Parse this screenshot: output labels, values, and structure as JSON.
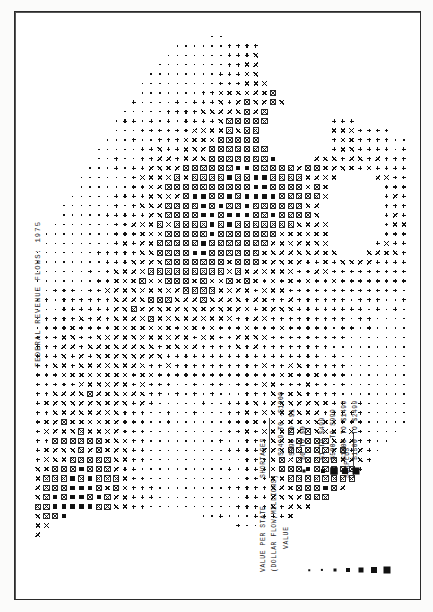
{
  "page": {
    "title": "FEDERAL REVENUE FLOWS: 1975",
    "background_color": "#ffffff",
    "ink_color": "#111111",
    "frame_color": "#2b2b2b"
  },
  "legend": {
    "title": "VALUE PER STATE",
    "subtitle": "(DOLLAR FLOW,MILLIONS)",
    "group_shortages": "SHORTAGES",
    "group_surplus": "SURPLUS",
    "entries": [
      {
        "symbol": "dot-xs",
        "size": 1,
        "label": "-$2499 TO -$1000",
        "group": "SHORTAGES"
      },
      {
        "symbol": "dot-s",
        "size": 2,
        "label": "-$999 TO -$1",
        "group": "SHORTAGES"
      },
      {
        "symbol": "dot-m",
        "size": 3,
        "label": "$0 TO $0",
        "group": "SHORTAGES"
      },
      {
        "symbol": "dot-l",
        "size": 4,
        "label": "$1 TO $499",
        "group": "SURPLUS"
      },
      {
        "symbol": "square-open",
        "size": 5,
        "label": "$500 TO $999",
        "group": "SURPLUS"
      },
      {
        "symbol": "square-m",
        "size": 6,
        "label": "$1000 TO $1499",
        "group": "SURPLUS"
      },
      {
        "symbol": "square-l",
        "size": 7,
        "label": "$1500 TO $2499",
        "group": "SURPLUS"
      }
    ],
    "symbol_strip_sizes": [
      1,
      2,
      3,
      4,
      5,
      6,
      7
    ],
    "value_per_state_caption": "VALUE"
  },
  "chart_data": {
    "type": "heatmap",
    "title": "FEDERAL REVENUE FLOWS: 1975",
    "xlabel": "",
    "ylabel": "",
    "grid": false,
    "legend_position": "bottom-right",
    "encoding": "symbol-size choropleth on a character grid; X = mid range, + = low range, filled square = high range",
    "categories": [
      "-$2499 TO -$1000",
      "-$999 TO -$1",
      "$0 TO $0",
      "$1 TO $499",
      "$500 TO $999",
      "$1000 TO $1499",
      "$1500 TO $2499"
    ],
    "values": [
      1,
      2,
      3,
      4,
      5,
      6,
      7
    ],
    "glyph_alphabet": [
      "x",
      "+",
      ".",
      "sq1",
      "sq2",
      "sq3",
      "sq4"
    ],
    "grid_cols": 46,
    "grid_rows": 62
  }
}
